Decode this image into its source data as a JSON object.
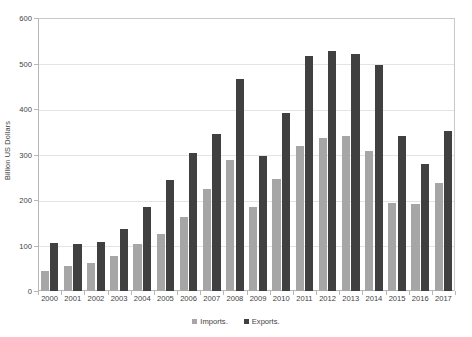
{
  "chart_data": {
    "type": "bar",
    "title": "",
    "subtitle": "",
    "xlabel": "",
    "ylabel": "Billion US Dollars",
    "categories": [
      "2000",
      "2001",
      "2002",
      "2003",
      "2004",
      "2005",
      "2006",
      "2007",
      "2008",
      "2009",
      "2010",
      "2011",
      "2012",
      "2013",
      "2014",
      "2015",
      "2016",
      "2017"
    ],
    "series": [
      {
        "name": "Imports.",
        "color": "#a6a6a6",
        "values": [
          44,
          54,
          62,
          76,
          104,
          125,
          163,
          224,
          289,
          185,
          247,
          318,
          337,
          340,
          307,
          193,
          192,
          238
        ]
      },
      {
        "name": "Exports.",
        "color": "#404040",
        "values": [
          106,
          104,
          108,
          136,
          184,
          243,
          304,
          345,
          466,
          297,
          392,
          517,
          527,
          522,
          496,
          341,
          280,
          352
        ]
      }
    ],
    "ylim": [
      0,
      600
    ],
    "yticks": [
      0,
      100,
      200,
      300,
      400,
      500,
      600
    ],
    "ytick_labels": [
      "0",
      "100",
      "200",
      "300",
      "400",
      "500",
      "600"
    ],
    "grid": true,
    "legend_position": "bottom"
  },
  "legend": {
    "items": [
      {
        "label": "Imports.",
        "swatch": "imports-swatch"
      },
      {
        "label": "Exports.",
        "swatch": "exports-swatch"
      }
    ]
  }
}
